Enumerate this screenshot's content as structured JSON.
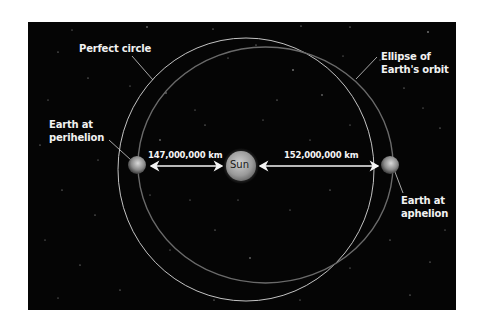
{
  "diagram": {
    "colors": {
      "background": "#050505",
      "perfect_circle": "#d8d8d8",
      "ellipse_orbit": "#6a6a6a",
      "text": "#f2f2f2",
      "sun": "#9a9a9a",
      "earth": "#8c8c8c",
      "arrow": "#f5f5f5"
    },
    "labels": {
      "perfect_circle": "Perfect circle",
      "ellipse_line1": "Ellipse of",
      "ellipse_line2": "Earth's orbit",
      "perihelion_line1": "Earth at",
      "perihelion_line2": "perihelion",
      "aphelion_line1": "Earth at",
      "aphelion_line2": "aphelion",
      "sun": "Sun"
    },
    "distances": {
      "perihelion": "147,000,000 km",
      "aphelion": "152,000,000 km"
    }
  }
}
